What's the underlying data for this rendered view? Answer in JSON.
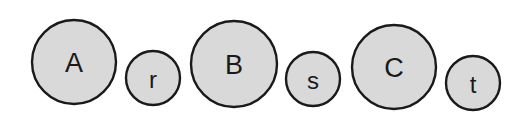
{
  "diagram": {
    "title": "",
    "colors": {
      "fill": "#d9d9d9",
      "stroke": "#1a1a1a",
      "text": "#1a1a1a",
      "background": "#ffffff"
    },
    "nodes": [
      {
        "label": "A",
        "size": "large",
        "cx": 74,
        "cy": 62,
        "r": 42,
        "font_size": 27
      },
      {
        "label": "r",
        "size": "small",
        "cx": 153,
        "cy": 78,
        "r": 27,
        "font_size": 24
      },
      {
        "label": "B",
        "size": "large",
        "cx": 234,
        "cy": 64,
        "r": 43,
        "font_size": 27
      },
      {
        "label": "s",
        "size": "small",
        "cx": 313,
        "cy": 79,
        "r": 27,
        "font_size": 24
      },
      {
        "label": "C",
        "size": "large",
        "cx": 394,
        "cy": 67,
        "r": 42,
        "font_size": 27
      },
      {
        "label": "t",
        "size": "small",
        "cx": 473,
        "cy": 83,
        "r": 27,
        "font_size": 24
      }
    ]
  }
}
